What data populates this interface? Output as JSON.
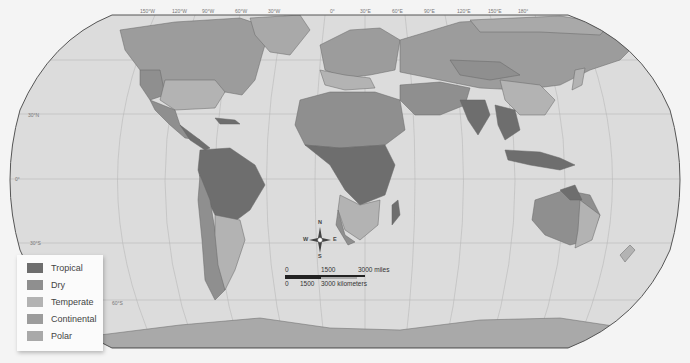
{
  "map": {
    "type": "world climate zones map",
    "projection": "Robinson",
    "colors": {
      "ocean": "#dcdcdc",
      "outside": "#f4f4f4",
      "graticule": "#b8b8b8",
      "border": "#555555"
    },
    "graticule_labels": {
      "longitudes": [
        "150°W",
        "120°W",
        "90°W",
        "60°W",
        "30°W",
        "0°",
        "30°E",
        "60°E",
        "90°E",
        "120°E",
        "150°E",
        "180°"
      ],
      "latitudes": [
        "30°N",
        "0°",
        "30°S",
        "60°S"
      ]
    }
  },
  "legend": {
    "items": [
      {
        "label": "Tropical",
        "color": "#6e6e6e"
      },
      {
        "label": "Dry",
        "color": "#8f8f8f"
      },
      {
        "label": "Temperate",
        "color": "#b3b3b3"
      },
      {
        "label": "Continental",
        "color": "#9c9c9c"
      },
      {
        "label": "Polar",
        "color": "#a9a9a9"
      }
    ]
  },
  "compass": {
    "n": "N",
    "s": "S",
    "e": "E",
    "w": "W"
  },
  "scale_bar": {
    "miles": {
      "zero": "0",
      "mid": "1500",
      "end": "3000 miles"
    },
    "kilometers": {
      "zero": "0",
      "mid": "1500",
      "end": "3000 kilometers"
    }
  }
}
